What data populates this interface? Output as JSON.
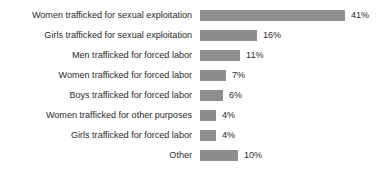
{
  "chart_data": {
    "type": "bar",
    "orientation": "horizontal",
    "title": "",
    "subtitle": "",
    "xlabel": "",
    "ylabel": "",
    "grid": false,
    "legend": false,
    "axis_visible": false,
    "xlim": [
      0,
      41
    ],
    "value_suffix": "%",
    "bar_color": "#8d8d8d",
    "label_color": "#2b2b2b",
    "background": "#ffffff",
    "categories": [
      "Women trafficked for sexual exploitation",
      "Girls trafficked for sexual exploitation",
      "Men trafficked for forced labor",
      "Women trafficked for forced labor",
      "Boys trafficked for forced labor",
      "Women trafficked for other purposes",
      "Girls trafficked for forced labor",
      "Other"
    ],
    "values": [
      41,
      16,
      11,
      7,
      6,
      4,
      4,
      10
    ],
    "value_labels": [
      "41%",
      "16%",
      "11%",
      "7%",
      "6%",
      "4%",
      "4%",
      "10%"
    ],
    "bars": [
      {
        "label": "Women trafficked for sexual exploitation",
        "value": 41,
        "value_label": "41%",
        "width_px": 145
      },
      {
        "label": "Girls trafficked for sexual exploitation",
        "value": 16,
        "value_label": "16%",
        "width_px": 57
      },
      {
        "label": "Men trafficked for forced labor",
        "value": 11,
        "value_label": "11%",
        "width_px": 40
      },
      {
        "label": "Women trafficked for forced labor",
        "value": 7,
        "value_label": "7%",
        "width_px": 26
      },
      {
        "label": "Boys trafficked for forced labor",
        "value": 6,
        "value_label": "6%",
        "width_px": 23
      },
      {
        "label": "Women trafficked for other purposes",
        "value": 4,
        "value_label": "4%",
        "width_px": 16
      },
      {
        "label": "Girls trafficked for forced labor",
        "value": 4,
        "value_label": "4%",
        "width_px": 16
      },
      {
        "label": "Other",
        "value": 10,
        "value_label": "10%",
        "width_px": 38
      }
    ]
  }
}
